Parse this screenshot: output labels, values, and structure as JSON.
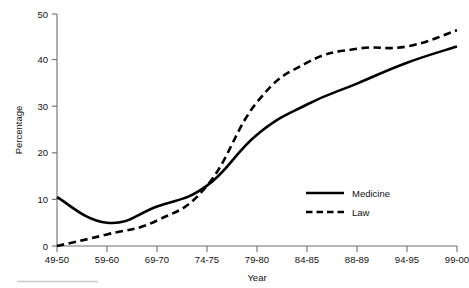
{
  "chart_data": {
    "type": "line",
    "title": "",
    "subtitle": "",
    "xlabel": "Year",
    "ylabel": "Percentage",
    "categories": [
      "49-50",
      "59-60",
      "69-70",
      "74-75",
      "79-80",
      "84-85",
      "88-89",
      "94-95",
      "99-00"
    ],
    "x_tick_labels": [
      "49-50",
      "59-60",
      "69-70",
      "74-75",
      "79-80",
      "84-85",
      "88-89",
      "94-95",
      "99-00"
    ],
    "y_tick_labels": [
      "0",
      "10",
      "20",
      "30",
      "40",
      "50"
    ],
    "y_ticks": [
      0,
      10,
      20,
      30,
      40,
      50
    ],
    "ylim": [
      0,
      50
    ],
    "grid": false,
    "legend_position": "inside-right",
    "series": [
      {
        "name": "Medicine",
        "style": "solid",
        "color": "#000000",
        "values": [
          10.5,
          5.0,
          8.5,
          13.0,
          24.0,
          30.5,
          35.0,
          39.5,
          43.0
        ]
      },
      {
        "name": "Law",
        "style": "dashed",
        "color": "#000000",
        "values": [
          0.0,
          2.5,
          5.5,
          13.0,
          31.0,
          39.5,
          42.5,
          43.0,
          46.5
        ]
      }
    ]
  },
  "legend": {
    "entries": [
      {
        "label": "Medicine",
        "style": "solid"
      },
      {
        "label": "Law",
        "style": "dashed"
      }
    ]
  },
  "axes": {
    "y_axis_title": "Percentage",
    "x_axis_title": "Year"
  }
}
